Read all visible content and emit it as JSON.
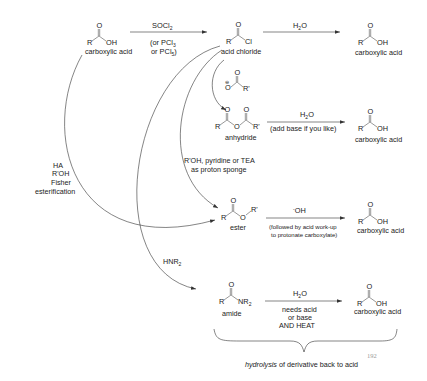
{
  "diagram": {
    "colors": {
      "line": "#333333",
      "text": "#222222",
      "page_number": "#999999"
    },
    "compounds": {
      "acid_start": {
        "name": "carboxylic acid",
        "R": "R",
        "X": "OH",
        "O": "O"
      },
      "acid_chloride": {
        "name": "acid chloride",
        "R": "R",
        "X": "Cl",
        "O": "O"
      },
      "carboxylate": {
        "R": "R'",
        "O": "O",
        "charge": "⊖"
      },
      "anhydride": {
        "name": "anhydride",
        "R1": "R",
        "R2": "R'",
        "O": "O"
      },
      "ester": {
        "name": "ester",
        "R": "R",
        "OR": "O",
        "R2": "R'",
        "O": "O"
      },
      "amide": {
        "name": "amide",
        "R": "R",
        "X": "NR",
        "sub": "2",
        "O": "O"
      },
      "acid_from_chloride": {
        "name": "carboxylic acid",
        "R": "R",
        "X": "OH",
        "O": "O"
      },
      "acid_from_anhydride": {
        "name": "carboxylic acid",
        "R": "R",
        "X": "OH",
        "O": "O"
      },
      "acid_from_ester": {
        "name": "carboxylic acid",
        "R": "R",
        "X": "OH",
        "O": "O"
      },
      "acid_from_amide": {
        "name": "carboxylic acid",
        "R": "R",
        "X": "OH",
        "O": "O"
      }
    },
    "reagents": {
      "socl2": {
        "main": "SOCl",
        "sub": "2"
      },
      "socl2_alt1": {
        "pre": "(or PCl",
        "sub": "3"
      },
      "socl2_alt2": {
        "pre": "or PCl",
        "sub": "5",
        "post": ")"
      },
      "h2o_chloride": {
        "pre": "H",
        "sub": "2",
        "post": "O"
      },
      "h2o_anhydride": {
        "pre": "H",
        "sub": "2",
        "post": "O"
      },
      "anhydride_note": "(add base if you like)",
      "alcohol_line1": "R'OH, pyridine or TEA",
      "alcohol_line2": "as proton sponge",
      "fisher_line1": "HA",
      "fisher_line2": "R'OH",
      "fisher_line3": "Fisher",
      "fisher_line4": "esterification",
      "hydroxide": {
        "sup": "-",
        "main": "OH"
      },
      "ester_note1": "(followed by acid work-up",
      "ester_note2": "to protonate carboxylate)",
      "amine": {
        "main": "HNR",
        "sub": "2"
      },
      "h2o_amide": {
        "pre": "H",
        "sub": "2",
        "post": "O"
      },
      "amide_note1": "needs acid",
      "amide_note2": "or base",
      "amide_note3": "AND HEAT"
    },
    "caption": {
      "italic": "hydrolysis",
      "rest": " of derivative back to acid"
    },
    "page_number": "192"
  }
}
